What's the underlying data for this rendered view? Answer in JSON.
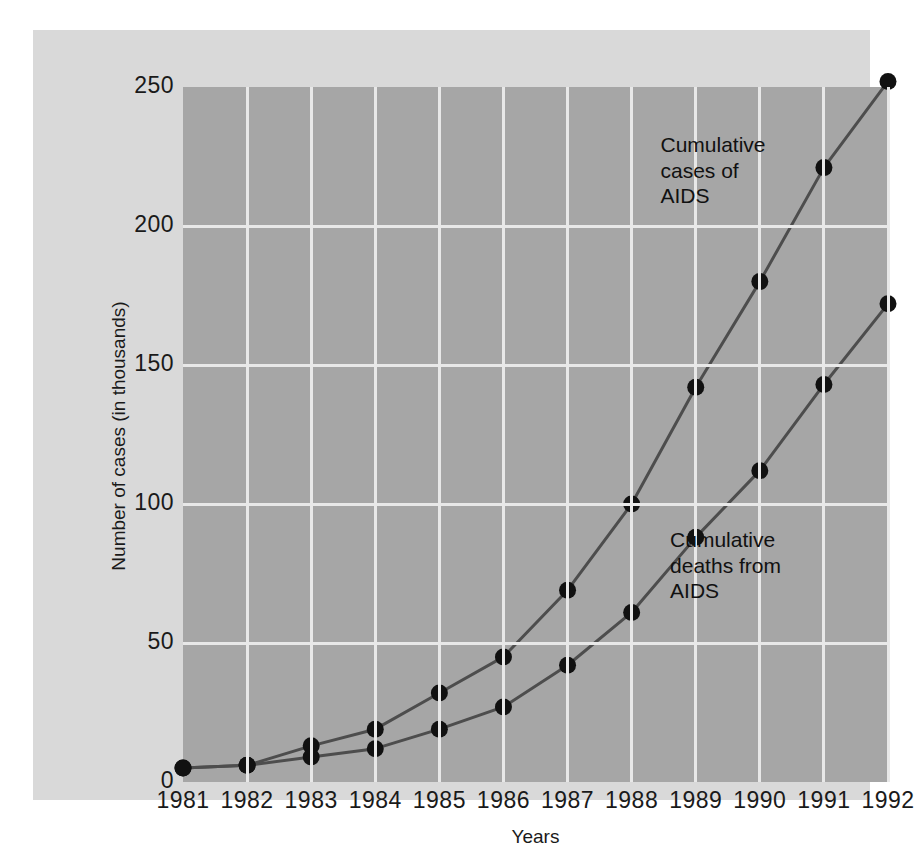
{
  "chart_data": {
    "type": "line",
    "title": "",
    "subtitle": "",
    "xlabel": "Years",
    "ylabel": "Number of cases (in thousands)",
    "categories": [
      "1981",
      "1982",
      "1983",
      "1984",
      "1985",
      "1986",
      "1987",
      "1988",
      "1989",
      "1990",
      "1991",
      "1992"
    ],
    "x": [
      1981,
      1982,
      1983,
      1984,
      1985,
      1986,
      1987,
      1988,
      1989,
      1990,
      1991,
      1992
    ],
    "xlim": [
      1981,
      1992
    ],
    "ylim": [
      0,
      250
    ],
    "yticks": [
      0,
      50,
      100,
      150,
      200,
      250
    ],
    "ytick_labels": [
      "0",
      "50",
      "100",
      "150",
      "200",
      "250"
    ],
    "grid": true,
    "grid_color": "#e8e8e8",
    "legend": "none",
    "panel_color": "#a6a6a6",
    "card_color": "#d9d9d9",
    "marker_color": "#111111",
    "line_color": "#4d4d4d",
    "series": [
      {
        "name": "Cumulative cases of AIDS",
        "values": [
          5,
          6,
          13,
          19,
          32,
          45,
          69,
          100,
          142,
          180,
          221,
          252
        ]
      },
      {
        "name": "Cumulative deaths from AIDS",
        "values": [
          5,
          6,
          9,
          12,
          19,
          27,
          42,
          61,
          88,
          112,
          143,
          172
        ]
      }
    ],
    "annotations": [
      {
        "text": "Cumulative\ncases of\nAIDS",
        "x": 1988.45,
        "y": 228
      },
      {
        "text": "Cumulative\ndeaths from\nAIDS",
        "x": 1988.6,
        "y": 86
      }
    ]
  }
}
